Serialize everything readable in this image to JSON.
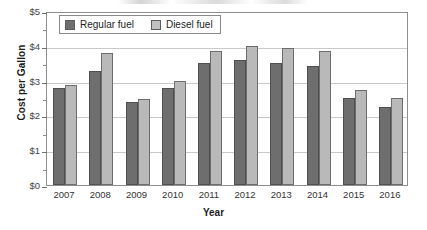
{
  "chart_data": {
    "type": "bar",
    "title": "",
    "xlabel": "Year",
    "ylabel": "Cost per Gallon",
    "categories": [
      "2007",
      "2008",
      "2009",
      "2010",
      "2011",
      "2012",
      "2013",
      "2014",
      "2015",
      "2016"
    ],
    "series": [
      {
        "name": "Regular fuel",
        "color": "#6e6e6e",
        "values": [
          2.78,
          3.28,
          2.39,
          2.78,
          3.52,
          3.6,
          3.52,
          3.42,
          2.5,
          2.25
        ]
      },
      {
        "name": "Diesel fuel",
        "color": "#b9b9b9",
        "values": [
          2.88,
          3.79,
          2.48,
          3.0,
          3.84,
          4.0,
          3.94,
          3.84,
          2.73,
          2.5
        ]
      }
    ],
    "ylim": [
      0,
      5
    ],
    "ytick_labels": [
      "$0",
      "$1",
      "$2",
      "$3",
      "$4",
      "$5"
    ],
    "ytick_values": [
      0,
      1,
      2,
      3,
      4,
      5
    ],
    "yminor_step": 0.5,
    "grid": true,
    "legend_position": "top-left"
  },
  "legend": {
    "items": [
      {
        "label": "Regular fuel"
      },
      {
        "label": "Diesel fuel"
      }
    ]
  },
  "axes": {
    "y_title": "Cost per Gallon",
    "x_title": "Year"
  }
}
